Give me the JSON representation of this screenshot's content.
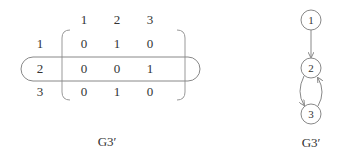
{
  "matrix": {
    "col_headers": [
      "1",
      "2",
      "3"
    ],
    "row_labels": [
      "1",
      "2",
      "3"
    ],
    "cells": [
      [
        "0",
        "1",
        "0"
      ],
      [
        "0",
        "0",
        "1"
      ],
      [
        "0",
        "1",
        "0"
      ]
    ],
    "highlighted_row": "2",
    "caption": "G3′"
  },
  "graph": {
    "nodes": [
      "1",
      "2",
      "3"
    ],
    "edges": [
      {
        "from": "1",
        "to": "2"
      },
      {
        "from": "2",
        "to": "3"
      },
      {
        "from": "3",
        "to": "2"
      }
    ],
    "caption": "G3′"
  },
  "colors": {
    "stroke": "#888888",
    "text": "#333333"
  }
}
